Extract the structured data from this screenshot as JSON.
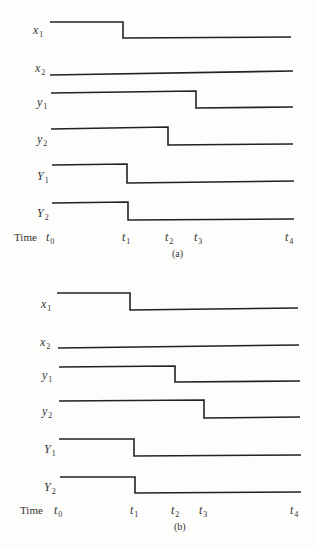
{
  "panels": [
    {
      "id": "a",
      "caption": "(a)",
      "time_label": "Time",
      "time_ticks": [
        {
          "base": "t",
          "sub": "0",
          "x": 48
        },
        {
          "base": "t",
          "sub": "1",
          "x": 124
        },
        {
          "base": "t",
          "sub": "2",
          "x": 167
        },
        {
          "base": "t",
          "sub": "3",
          "x": 196
        },
        {
          "base": "t",
          "sub": "4",
          "x": 287
        }
      ],
      "signals": [
        {
          "base": "x",
          "sub": "1",
          "start_level": "high",
          "transition_at": "t1",
          "end_level": "low"
        },
        {
          "base": "x",
          "sub": "2",
          "start_level": "low",
          "transition_at": null,
          "end_level": "low"
        },
        {
          "base": "y",
          "sub": "1",
          "start_level": "high",
          "transition_at": "t3",
          "end_level": "low"
        },
        {
          "base": "y",
          "sub": "2",
          "start_level": "high",
          "transition_at": "t2",
          "end_level": "low"
        },
        {
          "base": "Y",
          "sub": "1",
          "start_level": "high",
          "transition_at": "t1",
          "end_level": "low"
        },
        {
          "base": "Y",
          "sub": "2",
          "start_level": "high",
          "transition_at": "t1",
          "end_level": "low"
        }
      ]
    },
    {
      "id": "b",
      "caption": "(b)",
      "time_label": "Time",
      "time_ticks": [
        {
          "base": "t",
          "sub": "0",
          "x": 56
        },
        {
          "base": "t",
          "sub": "1",
          "x": 132
        },
        {
          "base": "t",
          "sub": "2",
          "x": 173
        },
        {
          "base": "t",
          "sub": "3",
          "x": 201
        },
        {
          "base": "t",
          "sub": "4",
          "x": 292
        }
      ],
      "signals": [
        {
          "base": "x",
          "sub": "1",
          "start_level": "high",
          "transition_at": "t1",
          "end_level": "low"
        },
        {
          "base": "x",
          "sub": "2",
          "start_level": "low",
          "transition_at": null,
          "end_level": "low"
        },
        {
          "base": "y",
          "sub": "1",
          "start_level": "high",
          "transition_at": "t2",
          "end_level": "low"
        },
        {
          "base": "y",
          "sub": "2",
          "start_level": "high",
          "transition_at": "t3",
          "end_level": "low"
        },
        {
          "base": "Y",
          "sub": "1",
          "start_level": "high",
          "transition_at": "t1",
          "end_level": "low"
        },
        {
          "base": "Y",
          "sub": "2",
          "start_level": "high",
          "transition_at": "t1",
          "end_level": "low"
        }
      ]
    }
  ],
  "waveforms": {
    "a": [
      {
        "points": "50,22 123,22 123,38 291,37"
      },
      {
        "points": "50,75 293,71"
      },
      {
        "points": "51,93 196,91 196,108 293,107"
      },
      {
        "points": "51,129 168,127 168,145 293,144"
      },
      {
        "points": "52,165 127,164 127,183 294,181"
      },
      {
        "points": "52,203 128,202 128,220 294,219"
      }
    ],
    "b": [
      {
        "points": "57,293 130,293 130,310 298,308"
      },
      {
        "points": "58,348 299,345"
      },
      {
        "points": "59,367 175,366 175,382 300,381"
      },
      {
        "points": "59,401 204,400 204,418 300,417"
      },
      {
        "points": "59,439 134,439 134,456 301,455"
      },
      {
        "points": "60,477 135,477 135,493 301,492"
      }
    ]
  },
  "label_positions": {
    "a": [
      {
        "x": 33,
        "y": 24
      },
      {
        "x": 35,
        "y": 62
      },
      {
        "x": 37,
        "y": 96
      },
      {
        "x": 37,
        "y": 133
      },
      {
        "x": 37,
        "y": 170
      },
      {
        "x": 37,
        "y": 207
      }
    ],
    "b": [
      {
        "x": 41,
        "y": 298
      },
      {
        "x": 40,
        "y": 336
      },
      {
        "x": 42,
        "y": 369
      },
      {
        "x": 42,
        "y": 405
      },
      {
        "x": 44,
        "y": 443
      },
      {
        "x": 44,
        "y": 481
      }
    ]
  },
  "time_row": {
    "a": {
      "word_x": 14,
      "y": 231,
      "caption_x": 172,
      "caption_y": 249
    },
    "b": {
      "word_x": 20,
      "y": 504,
      "caption_x": 174,
      "caption_y": 522
    }
  }
}
